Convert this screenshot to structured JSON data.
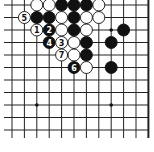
{
  "board": {
    "background": "#ffffff",
    "line_color": "#222222",
    "columns": 12,
    "rows": 11,
    "origin_x": 12,
    "origin_y": 5,
    "spacing_x": 12.4,
    "spacing_y": 12.5,
    "right_edge": true,
    "star_points": [
      [
        8,
        2
      ],
      [
        2,
        8
      ],
      [
        8,
        8
      ]
    ],
    "stones": [
      {
        "col": 2,
        "row": 0,
        "color": "white"
      },
      {
        "col": 3,
        "row": 0,
        "color": "white"
      },
      {
        "col": 4,
        "row": 0,
        "color": "black"
      },
      {
        "col": 5,
        "row": 0,
        "color": "black"
      },
      {
        "col": 6,
        "row": 0,
        "color": "black"
      },
      {
        "col": 7,
        "row": 0,
        "color": "white"
      },
      {
        "col": 1,
        "row": 1,
        "color": "white",
        "label": "5"
      },
      {
        "col": 2,
        "row": 1,
        "color": "black"
      },
      {
        "col": 3,
        "row": 1,
        "color": "black"
      },
      {
        "col": 4,
        "row": 1,
        "color": "white"
      },
      {
        "col": 5,
        "row": 1,
        "color": "black"
      },
      {
        "col": 6,
        "row": 1,
        "color": "white"
      },
      {
        "col": 7,
        "row": 1,
        "color": "white"
      },
      {
        "col": 2,
        "row": 2,
        "color": "white",
        "label": "1"
      },
      {
        "col": 3,
        "row": 2,
        "color": "black",
        "label": "2"
      },
      {
        "col": 4,
        "row": 2,
        "color": "white"
      },
      {
        "col": 5,
        "row": 2,
        "color": "black"
      },
      {
        "col": 6,
        "row": 2,
        "color": "white"
      },
      {
        "col": 9,
        "row": 2,
        "color": "black"
      },
      {
        "col": 3,
        "row": 3,
        "color": "black",
        "label": "4"
      },
      {
        "col": 4,
        "row": 3,
        "color": "white",
        "label": "3"
      },
      {
        "col": 5,
        "row": 3,
        "color": "white"
      },
      {
        "col": 6,
        "row": 3,
        "color": "black"
      },
      {
        "col": 8,
        "row": 3,
        "color": "black"
      },
      {
        "col": 4,
        "row": 4,
        "color": "white",
        "label": "7"
      },
      {
        "col": 5,
        "row": 4,
        "color": "white"
      },
      {
        "col": 6,
        "row": 4,
        "color": "black"
      },
      {
        "col": 5,
        "row": 5,
        "color": "black",
        "label": "6"
      },
      {
        "col": 6,
        "row": 5,
        "color": "white"
      },
      {
        "col": 8,
        "row": 5,
        "color": "black"
      }
    ]
  }
}
